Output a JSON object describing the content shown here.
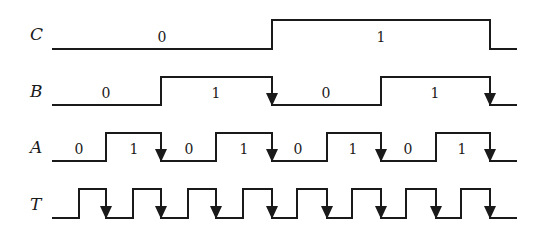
{
  "layout": {
    "x_start": 52,
    "x_end": 517
  },
  "signals": [
    {
      "name": "C",
      "high_y": 20,
      "low_y": 49,
      "label_y": 40,
      "initial": 0,
      "edges": [
        272,
        490
      ],
      "arrows": [],
      "values": [
        {
          "text": "0",
          "x": 162,
          "y": 42
        },
        {
          "text": "1",
          "x": 381,
          "y": 42
        }
      ]
    },
    {
      "name": "B",
      "high_y": 77,
      "low_y": 105,
      "label_y": 97,
      "initial": 0,
      "edges": [
        161,
        272,
        381,
        490
      ],
      "arrows": [
        272,
        490
      ],
      "values": [
        {
          "text": "0",
          "x": 106,
          "y": 98
        },
        {
          "text": "1",
          "x": 216,
          "y": 98
        },
        {
          "text": "0",
          "x": 326,
          "y": 98
        },
        {
          "text": "1",
          "x": 435,
          "y": 98
        }
      ]
    },
    {
      "name": "A",
      "high_y": 133,
      "low_y": 161,
      "label_y": 153,
      "initial": 0,
      "edges": [
        106,
        161,
        216,
        272,
        327,
        381,
        436,
        490
      ],
      "arrows": [
        161,
        272,
        381,
        490
      ],
      "values": [
        {
          "text": "0",
          "x": 79,
          "y": 154
        },
        {
          "text": "1",
          "x": 134,
          "y": 154
        },
        {
          "text": "0",
          "x": 189,
          "y": 154
        },
        {
          "text": "1",
          "x": 244,
          "y": 154
        },
        {
          "text": "0",
          "x": 298,
          "y": 154
        },
        {
          "text": "1",
          "x": 353,
          "y": 154
        },
        {
          "text": "0",
          "x": 408,
          "y": 154
        },
        {
          "text": "1",
          "x": 462,
          "y": 154
        }
      ]
    },
    {
      "name": "T",
      "high_y": 189,
      "low_y": 218,
      "label_y": 210,
      "initial": 0,
      "edges": [
        79,
        106,
        133,
        161,
        188,
        216,
        243,
        272,
        297,
        327,
        352,
        381,
        406,
        436,
        461,
        490
      ],
      "arrows": [
        106,
        161,
        216,
        272,
        327,
        381,
        436,
        490
      ],
      "values": []
    }
  ]
}
